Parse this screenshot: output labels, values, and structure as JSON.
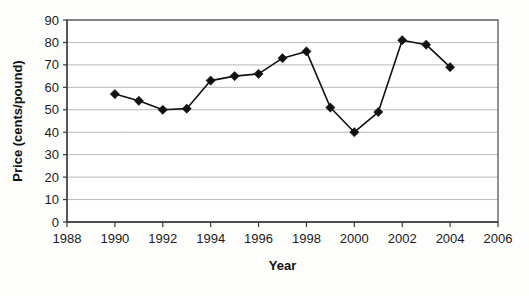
{
  "chart_data": {
    "type": "line",
    "title": "",
    "xlabel": "Year",
    "ylabel": "Price (cents/pound)",
    "xlim": [
      1988,
      2006
    ],
    "ylim": [
      0,
      90
    ],
    "xticks": [
      1988,
      1990,
      1992,
      1994,
      1996,
      1998,
      2000,
      2002,
      2004,
      2006
    ],
    "yticks": [
      0,
      10,
      20,
      30,
      40,
      50,
      60,
      70,
      80,
      90
    ],
    "grid": "horizontal",
    "legend": "none",
    "marker": "diamond",
    "marker_color": "#111111",
    "line_color": "#111111",
    "x": [
      1990,
      1991,
      1992,
      1993,
      1994,
      1995,
      1996,
      1997,
      1998,
      1999,
      2000,
      2001,
      2002,
      2003,
      2004
    ],
    "values": [
      57,
      54,
      50,
      50.5,
      63,
      65,
      66,
      73,
      76,
      51,
      40,
      49,
      81,
      79,
      69
    ],
    "series": [
      {
        "name": "Price",
        "values": [
          57,
          54,
          50,
          50.5,
          63,
          65,
          66,
          73,
          76,
          51,
          40,
          49,
          81,
          79,
          69
        ]
      }
    ]
  },
  "axes": {
    "y_title": "Price (cents/pound)",
    "x_title": "Year",
    "y_tick_labels": [
      "90",
      "80",
      "70",
      "60",
      "50",
      "40",
      "30",
      "20",
      "10",
      "0"
    ],
    "x_tick_labels": [
      "1988",
      "1990",
      "1992",
      "1994",
      "1996",
      "1998",
      "2000",
      "2002",
      "2004",
      "2006"
    ]
  }
}
